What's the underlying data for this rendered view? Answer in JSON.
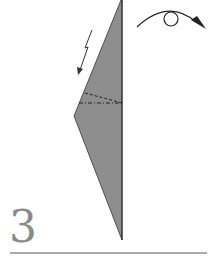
{
  "diagram": {
    "type": "origami-instruction-step",
    "step_number": "3",
    "colors": {
      "paper": "#8e8e8e",
      "outline": "#333333",
      "line": "#444444",
      "step_number": "#8a8a8a"
    },
    "symbols": [
      {
        "name": "turn-over-symbol",
        "meaning": "turn model over"
      },
      {
        "name": "zigzag-arrow",
        "meaning": "fold / move direction"
      },
      {
        "name": "valley-fold-line",
        "meaning": "dashed fold line"
      },
      {
        "name": "mountain-fold-line",
        "meaning": "dash-dot fold line"
      }
    ]
  }
}
